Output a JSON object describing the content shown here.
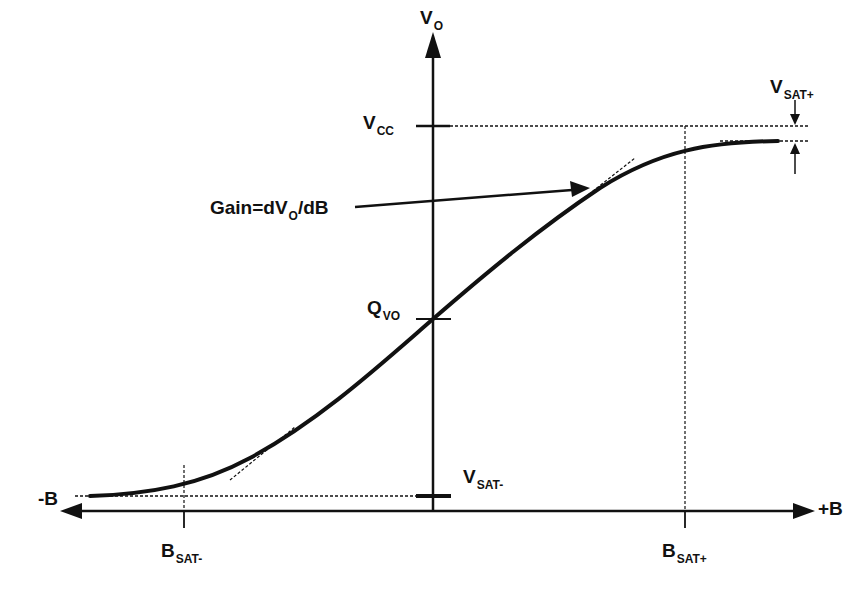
{
  "diagram": {
    "type": "transfer-characteristic",
    "colors": {
      "line": "#111111",
      "background": "#ffffff"
    },
    "axes": {
      "vertical": {
        "label_main": "V",
        "label_sub": "O"
      },
      "horizontal": {
        "negative_label": "-B",
        "positive_label": "+B"
      }
    },
    "labels": {
      "vcc": {
        "main": "V",
        "sub": "CC"
      },
      "vsat_plus": {
        "main": "V",
        "sub": "SAT+"
      },
      "vsat_minus": {
        "main": "V",
        "sub": "SAT-"
      },
      "qvo": {
        "main": "Q",
        "sub": "VO"
      },
      "bsat_minus": {
        "main": "B",
        "sub": "SAT-"
      },
      "bsat_plus": {
        "main": "B",
        "sub": "SAT+"
      },
      "gain": {
        "prefix": "Gain=dV",
        "sub": "O",
        "suffix": "/dB"
      }
    }
  }
}
